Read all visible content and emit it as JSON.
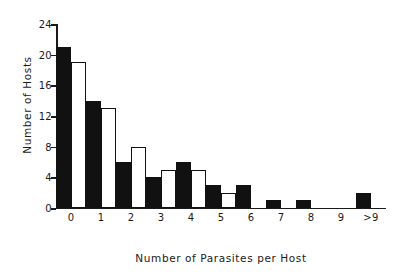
{
  "chart_data": {
    "type": "bar",
    "title": "",
    "xlabel": "Number of Parasites per Host",
    "ylabel": "Number of Hosts",
    "categories": [
      "0",
      "1",
      "2",
      "3",
      "4",
      "5",
      "6",
      "7",
      "8",
      "9",
      ">9"
    ],
    "series": [
      {
        "name": "observed",
        "style": "filled",
        "values": [
          21,
          14,
          6,
          4,
          6,
          3,
          3,
          1,
          1,
          0,
          2
        ]
      },
      {
        "name": "expected",
        "style": "open",
        "values": [
          19,
          13,
          8,
          5,
          5,
          2,
          0,
          0,
          0,
          0,
          0
        ]
      }
    ],
    "ylim": [
      0,
      24
    ],
    "yticks": [
      0,
      4,
      8,
      12,
      16,
      20,
      24
    ],
    "ytick_labels": [
      "0",
      "4",
      "8",
      "12",
      "16",
      "20",
      "24"
    ],
    "grid": false,
    "legend": "none",
    "colors": {
      "filled": "#111111",
      "open": "#ffffff",
      "axis": "#1a1a1a",
      "background": "#ffffff"
    }
  }
}
